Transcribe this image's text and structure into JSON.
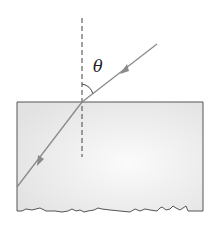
{
  "diagram": {
    "title": "",
    "labels": {
      "angle": "θ"
    },
    "elements": {
      "normal_line": {
        "style": "dashed",
        "x": 82,
        "y1": 18,
        "y2": 157
      },
      "incident_ray": {
        "from": [
          157,
          44
        ],
        "to": [
          82,
          102
        ],
        "direction": "toward surface"
      },
      "refracted_ray": {
        "from": [
          82,
          102
        ],
        "to": [
          17,
          187
        ],
        "direction": "into medium"
      },
      "medium_block": {
        "left": 17,
        "top": 102,
        "right": 203,
        "bottom_edge": "torn/jagged"
      },
      "angle_arc": {
        "between": [
          "normal",
          "incident_ray"
        ],
        "label": "θ"
      }
    },
    "colors": {
      "ray": "#8a8a8a",
      "outline": "#555555",
      "block_fill": "#e9e9e9",
      "dash": "#444444"
    }
  }
}
